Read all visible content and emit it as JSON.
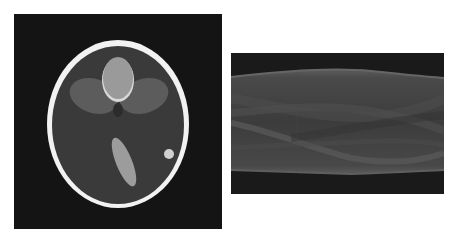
{
  "figure": {
    "panels": [
      {
        "id": "phantom",
        "description": "Shepp-Logan head phantom",
        "colors": {
          "background": "#141414",
          "skull": "#f2f2f2",
          "brain": "#3a3a3a",
          "side_ellipses": "#5c5c5c",
          "top_ellipse": "#9a9a9a",
          "bright_crescent": "#d8d8d8",
          "tilted_ellipse": "#9c9c9c",
          "small_dot": "#d0d0d0"
        }
      },
      {
        "id": "sinogram",
        "description": "Radon transform (sinogram) of the phantom",
        "colors": {
          "background": "#1a1a1a",
          "band_edge": "#606060",
          "band_fill": "#444444",
          "trace_light": "#5a5a5a",
          "trace_dark": "#383838"
        }
      }
    ]
  }
}
